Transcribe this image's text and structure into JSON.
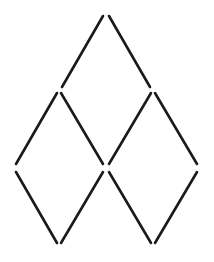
{
  "diagram": {
    "title": "",
    "stick_color": "#1a1a1a",
    "background": "#ffffff",
    "stick_count": 10,
    "sticks": [
      {
        "id": "top-left",
        "x1": 103,
        "y1": 16,
        "x2": 62,
        "y2": 87
      },
      {
        "id": "top-right",
        "x1": 109,
        "y1": 16,
        "x2": 150,
        "y2": 87
      },
      {
        "id": "left-upper-left",
        "x1": 57,
        "y1": 93,
        "x2": 16,
        "y2": 164
      },
      {
        "id": "left-upper-right",
        "x1": 61,
        "y1": 93,
        "x2": 103,
        "y2": 164
      },
      {
        "id": "right-upper-left",
        "x1": 151,
        "y1": 93,
        "x2": 109,
        "y2": 164
      },
      {
        "id": "right-upper-right",
        "x1": 155,
        "y1": 93,
        "x2": 197,
        "y2": 164
      },
      {
        "id": "left-lower-left",
        "x1": 16,
        "y1": 172,
        "x2": 57,
        "y2": 243
      },
      {
        "id": "left-lower-right",
        "x1": 103,
        "y1": 172,
        "x2": 61,
        "y2": 243
      },
      {
        "id": "right-lower-left",
        "x1": 109,
        "y1": 172,
        "x2": 151,
        "y2": 243
      },
      {
        "id": "right-lower-right",
        "x1": 197,
        "y1": 172,
        "x2": 155,
        "y2": 243
      }
    ]
  }
}
